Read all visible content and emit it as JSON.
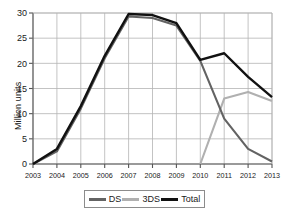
{
  "chart_data": {
    "type": "line",
    "title": "",
    "subtitle": "",
    "xlabel": "",
    "ylabel": "Million units",
    "x": [
      "2003",
      "2004",
      "2005",
      "2006",
      "2007",
      "2008",
      "2009",
      "2010",
      "2011",
      "2012",
      "2013"
    ],
    "xlim": [
      2003,
      2013
    ],
    "ylim": [
      0,
      30
    ],
    "yticks": [
      0,
      5,
      10,
      15,
      20,
      25,
      30
    ],
    "ytick_labels": [
      "0",
      "5",
      "10",
      "15",
      "20",
      "25",
      "30"
    ],
    "grid": true,
    "legend_position": "bottom",
    "series": [
      {
        "name": "DS",
        "color": "#636363",
        "values": [
          0,
          2.5,
          11.0,
          21.0,
          29.3,
          29.0,
          27.5,
          20.5,
          9.0,
          3.0,
          0.5
        ]
      },
      {
        "name": "3DS",
        "color": "#b0b0b0",
        "values": [
          null,
          null,
          null,
          null,
          null,
          null,
          null,
          0,
          13.0,
          14.3,
          12.5
        ]
      },
      {
        "name": "Total",
        "color": "#111111",
        "values": [
          0,
          3.0,
          11.5,
          21.5,
          29.8,
          29.6,
          28.0,
          20.7,
          22.0,
          17.3,
          13.3
        ]
      }
    ],
    "legend": [
      {
        "label": "DS",
        "color": "#636363"
      },
      {
        "label": "3DS",
        "color": "#b0b0b0"
      },
      {
        "label": "Total",
        "color": "#111111"
      }
    ]
  }
}
